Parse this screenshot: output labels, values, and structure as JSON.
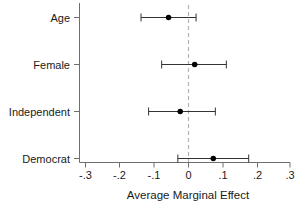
{
  "chart_data": {
    "type": "scatter",
    "title": "",
    "subtitle": "",
    "xlabel": "Average Marginal Effect",
    "ylabel": "",
    "orientation": "horizontal",
    "plot_style": "coefficient plot with 95% confidence intervals",
    "grid": false,
    "legend": null,
    "xlim": [
      -0.3,
      0.3
    ],
    "xticks": [
      -0.3,
      -0.2,
      -0.1,
      0,
      0.1,
      0.2,
      0.3
    ],
    "xticklabels": [
      "-.3",
      "-.2",
      "-.1",
      "0",
      ".1",
      ".2",
      ".3"
    ],
    "categories": [
      "Age",
      "Female",
      "Independent",
      "Democrat"
    ],
    "reference_line": {
      "value": 0,
      "style": "dashed",
      "color": "#b4b4b4",
      "orientation": "vertical"
    },
    "marker": {
      "shape": "circle",
      "color": "#000000",
      "size": 4
    },
    "error_bar": {
      "color": "#333333",
      "cap_style": "serif"
    },
    "points": [
      {
        "label": "Age",
        "estimate": -0.058,
        "ci_low": -0.138,
        "ci_high": 0.022
      },
      {
        "label": "Female",
        "estimate": 0.018,
        "ci_low": -0.078,
        "ci_high": 0.11
      },
      {
        "label": "Independent",
        "estimate": -0.024,
        "ci_low": -0.116,
        "ci_high": 0.078
      },
      {
        "label": "Democrat",
        "estimate": 0.072,
        "ci_low": -0.031,
        "ci_high": 0.175
      }
    ]
  },
  "axis": {
    "x_title": "Average Marginal Effect",
    "tick_labels": {
      "t0": "-.3",
      "t1": "-.2",
      "t2": "-.1",
      "t3": "0",
      "t4": ".1",
      "t5": ".2",
      "t6": ".3"
    },
    "category_labels": {
      "c0": "Age",
      "c1": "Female",
      "c2": "Independent",
      "c3": "Democrat"
    }
  },
  "colors": {
    "background": "#ffffff",
    "axis": "#6e6e6e",
    "text": "#1a1a1a",
    "marker": "#000000",
    "whisker": "#333333",
    "zero_line": "#b4b4b4"
  }
}
